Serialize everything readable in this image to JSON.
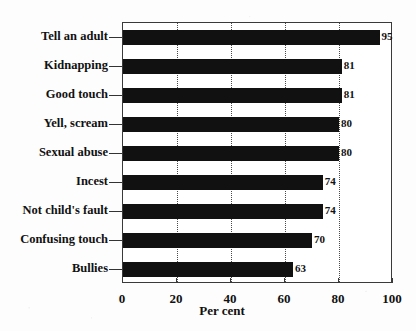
{
  "chart_data": {
    "type": "bar",
    "orientation": "horizontal",
    "title": "",
    "subtitle": "",
    "xlabel": "Per cent",
    "ylabel": "",
    "xlim": [
      0,
      100
    ],
    "xticks": [
      0,
      20,
      40,
      60,
      80,
      100
    ],
    "xticklabels": [
      "0",
      "20",
      "40",
      "60",
      "80",
      "100"
    ],
    "grid": "vertical-dotted",
    "legend": null,
    "bar_color": "#111111",
    "categories": [
      "Tell an adult",
      "Kidnapping",
      "Good touch",
      "Yell, scream",
      "Sexual abuse",
      "Incest",
      "Not child's fault",
      "Confusing touch",
      "Bullies"
    ],
    "values": [
      95,
      81,
      81,
      80,
      80,
      74,
      74,
      70,
      63
    ],
    "data_labels": [
      "95",
      "81",
      "81",
      "80",
      "80",
      "74",
      "74",
      "70",
      "63"
    ]
  }
}
